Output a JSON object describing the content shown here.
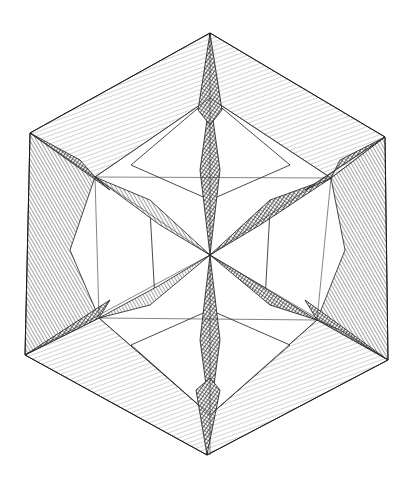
{
  "image": {
    "subject": "engraved stellated polyhedron",
    "style": "black-and-white line engraving with cross-hatching",
    "background": "#ffffff",
    "ink": "#1a1a1a"
  }
}
